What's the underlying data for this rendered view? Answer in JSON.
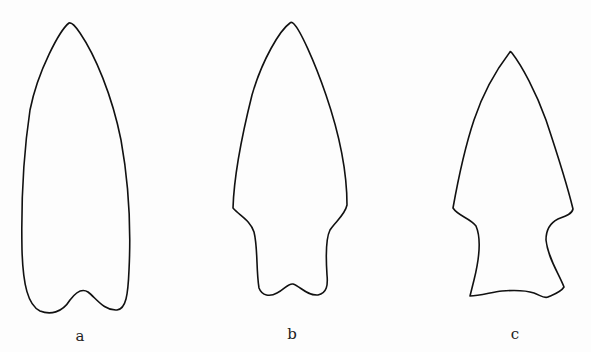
{
  "figure": {
    "items": [
      {
        "id": "a",
        "label": "a",
        "description": "lanceolate point with concave notched base"
      },
      {
        "id": "b",
        "label": "b",
        "description": "shouldered point with stem and notched base"
      },
      {
        "id": "c",
        "label": "c",
        "description": "shouldered point with expanding stem and flat base"
      }
    ]
  }
}
